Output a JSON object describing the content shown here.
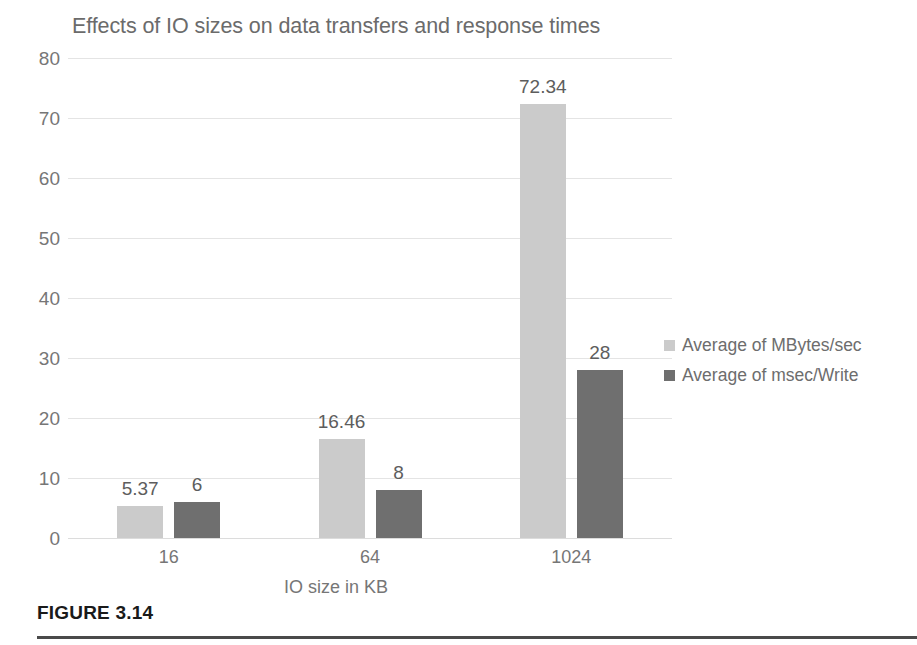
{
  "figure": {
    "caption": "FIGURE 3.14"
  },
  "chart_data": {
    "type": "bar",
    "title": "Effects of IO sizes on data transfers and response times",
    "xlabel": "IO size in KB",
    "ylabel": "",
    "categories": [
      "16",
      "64",
      "1024"
    ],
    "series": [
      {
        "name": "Average of MBytes/sec",
        "color": "#cbcbcb",
        "values": [
          5.37,
          16.46,
          72.34
        ],
        "labels": [
          "5.37",
          "16.46",
          "72.34"
        ]
      },
      {
        "name": "Average of msec/Write",
        "color": "#6f6f6f",
        "values": [
          6,
          8,
          28
        ],
        "labels": [
          "6",
          "8",
          "28"
        ]
      }
    ],
    "ylim": [
      0,
      80
    ],
    "yticks": [
      "80",
      "70",
      "60",
      "50",
      "40",
      "30",
      "20",
      "10",
      "0"
    ],
    "ytick_values": [
      80,
      70,
      60,
      50,
      40,
      30,
      20,
      10,
      0
    ],
    "grid": true,
    "legend_position": "right"
  }
}
